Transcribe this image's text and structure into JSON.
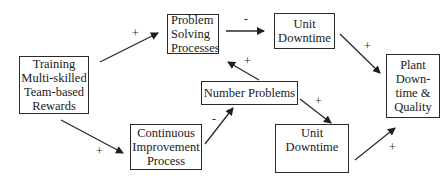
{
  "diagram": {
    "type": "causal-loop",
    "nodes": [
      {
        "id": "training",
        "lines": [
          "Training",
          "Multi-skilled",
          "Team-based",
          "Rewards"
        ]
      },
      {
        "id": "problem_solving",
        "lines": [
          "Problem",
          "Solving",
          "Processes"
        ]
      },
      {
        "id": "unit_downtime_top",
        "lines": [
          "Unit",
          "Downtime"
        ]
      },
      {
        "id": "plant_downtime",
        "lines": [
          "Plant",
          "Down-",
          "time &",
          "Quality"
        ]
      },
      {
        "id": "number_problems",
        "lines": [
          "Number Problems"
        ]
      },
      {
        "id": "continuous_improvement",
        "lines": [
          "Continuous",
          "Improvement",
          "Process"
        ]
      },
      {
        "id": "unit_downtime_bottom",
        "lines": [
          "Unit",
          "Downtime"
        ]
      }
    ],
    "edges": [
      {
        "from": "training",
        "to": "problem_solving",
        "sign": "+"
      },
      {
        "from": "training",
        "to": "continuous_improvement",
        "sign": "+"
      },
      {
        "from": "problem_solving",
        "to": "unit_downtime_top",
        "sign": "-"
      },
      {
        "from": "unit_downtime_top",
        "to": "plant_downtime",
        "sign": "+"
      },
      {
        "from": "number_problems",
        "to": "problem_solving",
        "sign": "+"
      },
      {
        "from": "continuous_improvement",
        "to": "number_problems",
        "sign": "-"
      },
      {
        "from": "number_problems",
        "to": "unit_downtime_bottom",
        "sign": "+"
      },
      {
        "from": "unit_downtime_bottom",
        "to": "plant_downtime",
        "sign": "+"
      }
    ]
  },
  "labels": {
    "training": {
      "l0": "Training",
      "l1": "Multi-skilled",
      "l2": "Team-based",
      "l3": "Rewards"
    },
    "problem_solving": {
      "l0": "Problem",
      "l1": "Solving",
      "l2": "Processes"
    },
    "unit_downtime_top": {
      "l0": "Unit",
      "l1": "Downtime"
    },
    "plant_downtime": {
      "l0": "Plant",
      "l1": "Down-",
      "l2": "time &",
      "l3": "Quality"
    },
    "number_problems": {
      "l0": "Number Problems"
    },
    "continuous_improvement": {
      "l0": "Continuous",
      "l1": "Improvement",
      "l2": "Process"
    },
    "unit_downtime_bottom": {
      "l0": "Unit",
      "l1": "Downtime"
    }
  },
  "signs": {
    "training_to_problem_solving": "+",
    "training_to_continuous_improvement": "+",
    "problem_solving_to_unit_downtime": "-",
    "unit_downtime_to_plant": "+",
    "number_problems_to_problem_solving": "+",
    "continuous_improvement_to_number_problems": "-",
    "number_problems_to_unit_downtime": "+",
    "unit_downtime_bottom_to_plant": "+"
  }
}
